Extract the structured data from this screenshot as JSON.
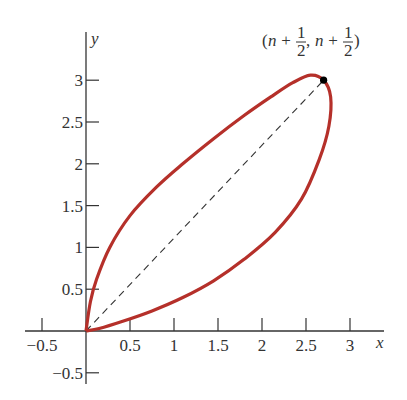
{
  "chart_data": {
    "type": "line",
    "title": "",
    "xlabel": "x",
    "ylabel": "y",
    "xlim": [
      -0.6,
      3.35
    ],
    "ylim": [
      -0.6,
      3.5
    ],
    "grid": false,
    "x_ticks": [
      -0.5,
      0.5,
      1,
      1.5,
      2,
      2.5,
      3
    ],
    "x_tick_labels": [
      "−0.5",
      "0.5",
      "1",
      "1.5",
      "2",
      "2.5",
      "3"
    ],
    "y_ticks": [
      -0.5,
      0.5,
      1,
      1.5,
      2,
      2.5,
      3
    ],
    "y_tick_labels": [
      "−0.5",
      "0.5",
      "1",
      "1.5",
      "2",
      "2.5",
      "3"
    ],
    "series": [
      {
        "name": "closed curve",
        "style": "solid",
        "color": "#b5302a",
        "points": [
          [
            0,
            0
          ],
          [
            0.05,
            0.35
          ],
          [
            0.12,
            0.62
          ],
          [
            0.27,
            1.0
          ],
          [
            0.5,
            1.38
          ],
          [
            0.8,
            1.72
          ],
          [
            1.1,
            2.0
          ],
          [
            1.45,
            2.3
          ],
          [
            1.8,
            2.58
          ],
          [
            2.1,
            2.8
          ],
          [
            2.35,
            2.97
          ],
          [
            2.55,
            3.06
          ],
          [
            2.7,
            3.0
          ],
          [
            2.78,
            2.8
          ],
          [
            2.76,
            2.45
          ],
          [
            2.65,
            2.05
          ],
          [
            2.45,
            1.58
          ],
          [
            2.15,
            1.18
          ],
          [
            1.8,
            0.86
          ],
          [
            1.45,
            0.6
          ],
          [
            1.1,
            0.4
          ],
          [
            0.75,
            0.24
          ],
          [
            0.4,
            0.11
          ],
          [
            0.15,
            0.03
          ],
          [
            0,
            0
          ]
        ]
      },
      {
        "name": "diagonal",
        "style": "dashed",
        "color": "#333333",
        "points": [
          [
            0,
            0
          ],
          [
            2.7,
            3.0
          ]
        ]
      }
    ],
    "annotations": [
      {
        "text": "(n + 1/2, n + 1/2)",
        "x": 2.7,
        "y": 3.0,
        "marker": "dot"
      }
    ]
  },
  "labels": {
    "x_axis": "x",
    "y_axis": "y",
    "annotation_open": "(",
    "annotation_n1": "n",
    "annotation_plus1": " + ",
    "annotation_num1": "1",
    "annotation_den1": "2",
    "annotation_comma": ",",
    "annotation_n2": "n",
    "annotation_plus2": " + ",
    "annotation_num2": "1",
    "annotation_den2": "2",
    "annotation_close": ")"
  }
}
